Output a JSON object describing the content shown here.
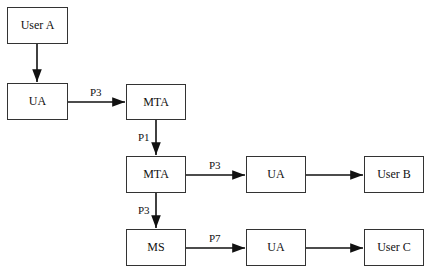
{
  "diagram": {
    "nodes": [
      {
        "id": "user_a",
        "label": "User A",
        "x": 7,
        "y": 7,
        "w": 61,
        "h": 37
      },
      {
        "id": "ua1",
        "label": "UA",
        "x": 7,
        "y": 83,
        "w": 61,
        "h": 37
      },
      {
        "id": "mta1",
        "label": "MTA",
        "x": 126,
        "y": 84,
        "w": 60,
        "h": 36
      },
      {
        "id": "mta2",
        "label": "MTA",
        "x": 126,
        "y": 156,
        "w": 60,
        "h": 37
      },
      {
        "id": "ua2",
        "label": "UA",
        "x": 246,
        "y": 156,
        "w": 60,
        "h": 37
      },
      {
        "id": "user_b",
        "label": "User B",
        "x": 364,
        "y": 156,
        "w": 60,
        "h": 37
      },
      {
        "id": "ms",
        "label": "MS",
        "x": 126,
        "y": 229,
        "w": 60,
        "h": 37
      },
      {
        "id": "ua3",
        "label": "UA",
        "x": 246,
        "y": 229,
        "w": 60,
        "h": 37
      },
      {
        "id": "user_c",
        "label": "User C",
        "x": 364,
        "y": 229,
        "w": 60,
        "h": 37
      }
    ],
    "edges": [
      {
        "from": "user_a",
        "to": "ua1",
        "label": ""
      },
      {
        "from": "ua1",
        "to": "mta1",
        "label": "P3"
      },
      {
        "from": "mta1",
        "to": "mta2",
        "label": "P1"
      },
      {
        "from": "mta2",
        "to": "ua2",
        "label": "P3"
      },
      {
        "from": "ua2",
        "to": "user_b",
        "label": ""
      },
      {
        "from": "mta2",
        "to": "ms",
        "label": "P3"
      },
      {
        "from": "ms",
        "to": "ua3",
        "label": "P7"
      },
      {
        "from": "ua3",
        "to": "user_c",
        "label": ""
      }
    ]
  }
}
